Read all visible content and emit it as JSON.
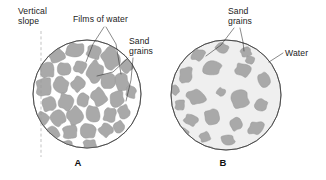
{
  "figure": {
    "background_color": "#ffffff",
    "grain_color": "#a9a9a9",
    "grain_edge_color": "#9b9b9b",
    "water_film_color": "#ffffff",
    "water_body_color": "#efefef",
    "outline_color": "#3b3b3b",
    "leader_color": "#2b2b2b",
    "dash_color": "#9a9a9a",
    "text_color": "#1a1a1a"
  },
  "panel_a": {
    "caption": "A",
    "caption_x": 78,
    "caption_y": 166,
    "circle": {
      "cx": 87,
      "cy": 94,
      "r": 54
    },
    "vertical_slope_label": {
      "line1": "Vertical",
      "line2": "slope",
      "x": 18,
      "y1": 14,
      "y2": 24
    },
    "dashed_line": {
      "x": 41,
      "y1": 31,
      "y2": 157
    },
    "films_of_water_label": {
      "text": "Films of water",
      "x": 73,
      "y": 22
    },
    "sand_grains_label": {
      "line1": "Sand",
      "line2": "grains",
      "x": 129,
      "y1": 44,
      "y2": 54
    }
  },
  "panel_b": {
    "caption": "B",
    "caption_x": 223,
    "caption_y": 166,
    "circle": {
      "cx": 226,
      "cy": 95,
      "r": 55
    },
    "sand_grains_label": {
      "line1": "Sand",
      "line2": "grains",
      "x": 228,
      "y1": 14,
      "y2": 24
    },
    "water_label": {
      "text": "Water",
      "x": 285,
      "y": 56
    }
  },
  "chart_data": {
    "type": "diagram",
    "panels": [
      {
        "id": "A",
        "caption": "A",
        "description": "Densely packed sand grains separated by thin films of water, with a vertical slope indicated by a dashed line",
        "grain_count": 33,
        "packing": "dense",
        "pore_fill": "thin water films",
        "labels": [
          "Vertical slope",
          "Films of water",
          "Sand grains"
        ]
      },
      {
        "id": "B",
        "caption": "B",
        "description": "Sand grains dispersed and separated within a body of water, no grain-to-grain contact",
        "grain_count": 22,
        "packing": "dispersed",
        "pore_fill": "water",
        "labels": [
          "Sand grains",
          "Water"
        ]
      }
    ]
  },
  "grains_a": [
    {
      "cx": 56,
      "cy": 55,
      "rx": 8.5,
      "ry": 7.5,
      "rot": 18
    },
    {
      "cx": 75,
      "cy": 50,
      "rx": 9.5,
      "ry": 7.0,
      "rot": -12
    },
    {
      "cx": 94,
      "cy": 52,
      "rx": 7.5,
      "ry": 7.0,
      "rot": 30
    },
    {
      "cx": 111,
      "cy": 58,
      "rx": 9.0,
      "ry": 11.5,
      "rot": -8
    },
    {
      "cx": 127,
      "cy": 66,
      "rx": 6.0,
      "ry": 7.0,
      "rot": 22
    },
    {
      "cx": 47,
      "cy": 70,
      "rx": 7.5,
      "ry": 8.0,
      "rot": -20
    },
    {
      "cx": 64,
      "cy": 69,
      "rx": 7.0,
      "ry": 6.5,
      "rot": 12
    },
    {
      "cx": 80,
      "cy": 67,
      "rx": 6.5,
      "ry": 6.0,
      "rot": -25
    },
    {
      "cx": 95,
      "cy": 72,
      "rx": 8.0,
      "ry": 11.0,
      "rot": 8
    },
    {
      "cx": 122,
      "cy": 82,
      "rx": 7.0,
      "ry": 9.5,
      "rot": -14
    },
    {
      "cx": 44,
      "cy": 87,
      "rx": 8.0,
      "ry": 9.5,
      "rot": 14
    },
    {
      "cx": 61,
      "cy": 85,
      "rx": 7.5,
      "ry": 8.5,
      "rot": -18
    },
    {
      "cx": 78,
      "cy": 84,
      "rx": 6.5,
      "ry": 7.5,
      "rot": 26
    },
    {
      "cx": 108,
      "cy": 81,
      "rx": 7.5,
      "ry": 8.0,
      "rot": -6
    },
    {
      "cx": 49,
      "cy": 104,
      "rx": 7.0,
      "ry": 7.5,
      "rot": 20
    },
    {
      "cx": 66,
      "cy": 102,
      "rx": 7.5,
      "ry": 8.5,
      "rot": -16
    },
    {
      "cx": 83,
      "cy": 100,
      "rx": 6.0,
      "ry": 7.0,
      "rot": 10
    },
    {
      "cx": 99,
      "cy": 97,
      "rx": 7.5,
      "ry": 9.0,
      "rot": -22
    },
    {
      "cx": 117,
      "cy": 99,
      "rx": 7.0,
      "ry": 8.5,
      "rot": 16
    },
    {
      "cx": 131,
      "cy": 92,
      "rx": 5.0,
      "ry": 6.5,
      "rot": -10
    },
    {
      "cx": 42,
      "cy": 119,
      "rx": 6.5,
      "ry": 7.0,
      "rot": 24
    },
    {
      "cx": 58,
      "cy": 118,
      "rx": 7.5,
      "ry": 8.0,
      "rot": -12
    },
    {
      "cx": 75,
      "cy": 116,
      "rx": 8.0,
      "ry": 9.0,
      "rot": 8
    },
    {
      "cx": 93,
      "cy": 114,
      "rx": 7.0,
      "ry": 8.5,
      "rot": -20
    },
    {
      "cx": 110,
      "cy": 115,
      "rx": 6.5,
      "ry": 7.5,
      "rot": 18
    },
    {
      "cx": 124,
      "cy": 112,
      "rx": 6.0,
      "ry": 7.0,
      "rot": -6
    },
    {
      "cx": 52,
      "cy": 134,
      "rx": 7.0,
      "ry": 7.5,
      "rot": 12
    },
    {
      "cx": 70,
      "cy": 132,
      "rx": 7.5,
      "ry": 7.0,
      "rot": -24
    },
    {
      "cx": 88,
      "cy": 131,
      "rx": 8.0,
      "ry": 7.5,
      "rot": 16
    },
    {
      "cx": 106,
      "cy": 130,
      "rx": 7.0,
      "ry": 6.5,
      "rot": -10
    },
    {
      "cx": 119,
      "cy": 127,
      "rx": 5.5,
      "ry": 6.0,
      "rot": 20
    },
    {
      "cx": 67,
      "cy": 146,
      "rx": 6.5,
      "ry": 5.5,
      "rot": -14
    },
    {
      "cx": 90,
      "cy": 145,
      "rx": 7.0,
      "ry": 5.5,
      "rot": 10
    }
  ],
  "grains_b": [
    {
      "cx": 198,
      "cy": 55,
      "rx": 7.0,
      "ry": 5.5,
      "rot": -20
    },
    {
      "cx": 222,
      "cy": 48,
      "rx": 6.5,
      "ry": 5.0,
      "rot": 15
    },
    {
      "cx": 246,
      "cy": 52,
      "rx": 5.5,
      "ry": 5.0,
      "rot": -8
    },
    {
      "cx": 186,
      "cy": 75,
      "rx": 6.5,
      "ry": 8.5,
      "rot": 22
    },
    {
      "cx": 212,
      "cy": 68,
      "rx": 9.5,
      "ry": 7.0,
      "rot": -14
    },
    {
      "cx": 243,
      "cy": 70,
      "rx": 8.0,
      "ry": 6.5,
      "rot": 10
    },
    {
      "cx": 264,
      "cy": 80,
      "rx": 6.0,
      "ry": 7.5,
      "rot": -18
    },
    {
      "cx": 196,
      "cy": 97,
      "rx": 9.5,
      "ry": 7.0,
      "rot": 16
    },
    {
      "cx": 221,
      "cy": 92,
      "rx": 4.5,
      "ry": 4.0,
      "rot": 0
    },
    {
      "cx": 240,
      "cy": 99,
      "rx": 9.0,
      "ry": 9.5,
      "rot": -12
    },
    {
      "cx": 180,
      "cy": 105,
      "rx": 5.0,
      "ry": 5.5,
      "rot": 20
    },
    {
      "cx": 261,
      "cy": 105,
      "rx": 6.5,
      "ry": 6.0,
      "rot": -22
    },
    {
      "cx": 191,
      "cy": 120,
      "rx": 7.0,
      "ry": 5.5,
      "rot": 12
    },
    {
      "cx": 212,
      "cy": 117,
      "rx": 7.5,
      "ry": 8.0,
      "rot": -16
    },
    {
      "cx": 236,
      "cy": 124,
      "rx": 6.0,
      "ry": 6.5,
      "rot": 8
    },
    {
      "cx": 256,
      "cy": 128,
      "rx": 8.5,
      "ry": 6.0,
      "rot": -26
    },
    {
      "cx": 183,
      "cy": 133,
      "rx": 6.0,
      "ry": 5.0,
      "rot": 18
    },
    {
      "cx": 205,
      "cy": 137,
      "rx": 5.5,
      "ry": 5.0,
      "rot": -10
    },
    {
      "cx": 228,
      "cy": 140,
      "rx": 7.0,
      "ry": 5.0,
      "rot": 14
    },
    {
      "cx": 207,
      "cy": 150,
      "rx": 5.5,
      "ry": 3.5,
      "rot": -12
    },
    {
      "cx": 250,
      "cy": 60,
      "rx": 4.5,
      "ry": 4.0,
      "rot": 5
    },
    {
      "cx": 175,
      "cy": 90,
      "rx": 4.0,
      "ry": 5.0,
      "rot": -15
    }
  ]
}
